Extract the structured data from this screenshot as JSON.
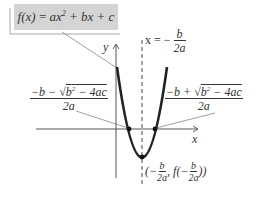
{
  "diagram": {
    "function_label": "f(x) = ax² + bx + c",
    "function_parts": {
      "fx": "f(x)",
      "eq": " = ",
      "a_term": "ax",
      "exp": "2",
      "rest": " + bx + c"
    },
    "axis_of_symmetry": {
      "prefix": "x = −",
      "num": "b",
      "den": "2a"
    },
    "y_axis_label": "y",
    "x_axis_label": "x",
    "left_root": {
      "num_pre": "−b − ",
      "radicand_b": "b",
      "radicand_exp": "2",
      "radicand_rest": " − 4ac",
      "den": "2a"
    },
    "right_root": {
      "num_pre": "−b + ",
      "radicand_b": "b",
      "radicand_exp": "2",
      "radicand_rest": " − 4ac",
      "den": "2a"
    },
    "vertex": {
      "open": "(−",
      "num": "b",
      "den": "2a",
      "mid": ", f(−",
      "num2": "b",
      "den2": "2a",
      "close": "))"
    },
    "colors": {
      "curve": "#222222",
      "axes": "#333333",
      "box": "#d4d4d4",
      "leader": "#888888"
    }
  }
}
